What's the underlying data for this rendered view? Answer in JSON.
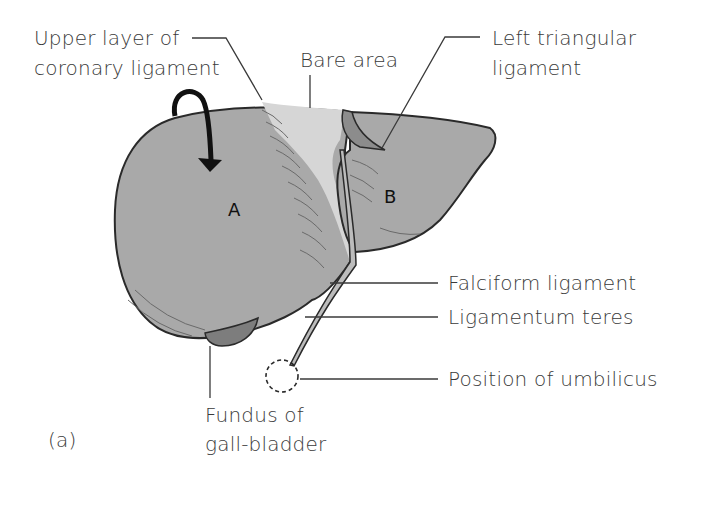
{
  "figure": {
    "panel_label": "(a)",
    "colors": {
      "liver_fill": "#a9a9a9",
      "bare_area_fill": "#d6d6d6",
      "gallbladder_fill": "#7d7d7d",
      "outline": "#2a2a2a",
      "label_text": "#3a3a3a"
    },
    "lobes": [
      {
        "id": "A",
        "label": "A"
      },
      {
        "id": "B",
        "label": "B"
      }
    ],
    "labels": {
      "upper_coronary": {
        "line1": "Upper layer of",
        "line2": "coronary ligament"
      },
      "bare_area": {
        "text": "Bare area"
      },
      "left_triangular": {
        "line1": "Left triangular",
        "line2": "ligament"
      },
      "falciform": {
        "text": "Falciform ligament"
      },
      "ligamentum_teres": {
        "text": "Ligamentum teres"
      },
      "umbilicus": {
        "text": "Position of umbilicus"
      },
      "gallbladder": {
        "line1": "Fundus of",
        "line2": "gall-bladder"
      }
    }
  }
}
